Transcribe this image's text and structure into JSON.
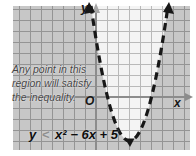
{
  "figure": {
    "type": "quadratic-inequality-graph",
    "colors": {
      "background": "#ffffff",
      "shaded_region": "#c7c7c7",
      "shaded_grid_line": "#949494",
      "solution_region": "#f4f4f4",
      "solution_grid_line": "#b9b9b9",
      "axis": "#8c8c8c",
      "curve": "#171717",
      "annotation_text": "#454545",
      "relation_symbol": "#8f8f8f"
    },
    "axes": {
      "x_label": "x",
      "y_label": "y",
      "origin_label": "O"
    },
    "curve": {
      "style": "dashed",
      "opens": "upward",
      "vertex": [
        3,
        -4
      ],
      "x_intercepts": [
        1,
        5
      ],
      "y_intercept": 5
    },
    "annotation": {
      "lines": [
        "Any point in this",
        "region will satisfy",
        "the inequality."
      ]
    },
    "inequality": {
      "lhs": "y",
      "relation": "<",
      "rhs": "x² − 6x + 5"
    }
  }
}
